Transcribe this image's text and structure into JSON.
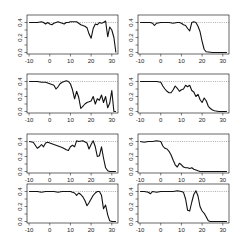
{
  "chart_data": {
    "type": "line",
    "layout": {
      "rows": 4,
      "cols": 2,
      "grid": false,
      "legend": "none"
    },
    "xlim": [
      -11,
      33
    ],
    "ylim": [
      -0.02,
      0.5
    ],
    "x_ticks": [
      -10,
      0,
      10,
      20,
      30
    ],
    "x_tick_labels": [
      "-10",
      "0",
      "10",
      "20",
      "30"
    ],
    "y_ticks": [
      0.0,
      0.2,
      0.4
    ],
    "y_tick_labels": [
      "0.0",
      "0.2",
      "0.4"
    ],
    "reference_line": {
      "y": 0.4,
      "style": "dotted"
    },
    "panels": [
      {
        "id": "r1c1",
        "x": [
          -10,
          -8,
          -6,
          -4,
          -3,
          -2,
          -1,
          0,
          1,
          2,
          3,
          4,
          5,
          6,
          7,
          8,
          9,
          10,
          11,
          12,
          13,
          14,
          15,
          16,
          17,
          18,
          19,
          20,
          21,
          22,
          23,
          24,
          25,
          26,
          27,
          28,
          29,
          30,
          31,
          32
        ],
        "y": [
          0.4,
          0.4,
          0.4,
          0.41,
          0.4,
          0.38,
          0.4,
          0.38,
          0.37,
          0.39,
          0.4,
          0.41,
          0.4,
          0.39,
          0.38,
          0.4,
          0.4,
          0.41,
          0.41,
          0.41,
          0.41,
          0.39,
          0.37,
          0.36,
          0.35,
          0.33,
          0.25,
          0.19,
          0.32,
          0.38,
          0.37,
          0.4,
          0.39,
          0.4,
          0.42,
          0.21,
          0.34,
          0.3,
          0.2,
          0.0
        ]
      },
      {
        "id": "r1c2",
        "x": [
          -10,
          -8,
          -6,
          -5,
          -4,
          -3,
          -2,
          0,
          2,
          4,
          6,
          8,
          9,
          10,
          11,
          12,
          13,
          14,
          15,
          16,
          17,
          18,
          19,
          20,
          21,
          22,
          25,
          28,
          30,
          32
        ],
        "y": [
          0.4,
          0.4,
          0.4,
          0.4,
          0.39,
          0.36,
          0.39,
          0.4,
          0.4,
          0.4,
          0.39,
          0.4,
          0.4,
          0.39,
          0.37,
          0.36,
          0.32,
          0.29,
          0.4,
          0.41,
          0.4,
          0.35,
          0.28,
          0.15,
          0.04,
          0.01,
          0.0,
          0.0,
          0.0,
          0.0
        ]
      },
      {
        "id": "r2c1",
        "x": [
          -10,
          -8,
          -6,
          -4,
          -2,
          0,
          1,
          2,
          3,
          4,
          5,
          6,
          7,
          8,
          9,
          10,
          11,
          12,
          13,
          14,
          15,
          16,
          17,
          18,
          19,
          20,
          21,
          22,
          23,
          24,
          25,
          26,
          27,
          28,
          29,
          30,
          31,
          32
        ],
        "y": [
          0.4,
          0.4,
          0.4,
          0.39,
          0.39,
          0.37,
          0.36,
          0.35,
          0.3,
          0.33,
          0.37,
          0.39,
          0.4,
          0.41,
          0.4,
          0.37,
          0.29,
          0.17,
          0.27,
          0.19,
          0.04,
          0.07,
          0.1,
          0.12,
          0.13,
          0.14,
          0.2,
          0.1,
          0.17,
          0.15,
          0.22,
          0.12,
          0.2,
          0.05,
          0.11,
          0.28,
          0.0,
          0.0
        ]
      },
      {
        "id": "r2c2",
        "x": [
          -10,
          -8,
          -6,
          -4,
          -2,
          0,
          1,
          2,
          3,
          4,
          5,
          6,
          7,
          8,
          9,
          10,
          11,
          12,
          13,
          14,
          15,
          16,
          17,
          18,
          19,
          20,
          21,
          22,
          23,
          24,
          25,
          26,
          28,
          30,
          32
        ],
        "y": [
          0.4,
          0.4,
          0.4,
          0.4,
          0.4,
          0.39,
          0.34,
          0.3,
          0.27,
          0.25,
          0.25,
          0.29,
          0.34,
          0.31,
          0.27,
          0.29,
          0.3,
          0.35,
          0.33,
          0.35,
          0.28,
          0.26,
          0.2,
          0.23,
          0.16,
          0.12,
          0.18,
          0.14,
          0.07,
          0.04,
          0.02,
          0.01,
          0.0,
          0.0,
          0.0
        ]
      },
      {
        "id": "r3c1",
        "x": [
          -10,
          -8,
          -7,
          -6,
          -5,
          -4,
          -3,
          -2,
          -1,
          0,
          2,
          4,
          6,
          8,
          9,
          10,
          11,
          12,
          13,
          14,
          16,
          18,
          19,
          20,
          21,
          22,
          23,
          24,
          25,
          26,
          27,
          28,
          29,
          30,
          32
        ],
        "y": [
          0.4,
          0.39,
          0.35,
          0.31,
          0.33,
          0.36,
          0.33,
          0.38,
          0.39,
          0.38,
          0.36,
          0.34,
          0.32,
          0.29,
          0.28,
          0.33,
          0.35,
          0.33,
          0.41,
          0.4,
          0.41,
          0.38,
          0.3,
          0.36,
          0.41,
          0.33,
          0.2,
          0.21,
          0.33,
          0.18,
          0.05,
          0.01,
          0.0,
          0.0,
          0.0
        ]
      },
      {
        "id": "r3c2",
        "x": [
          -10,
          -8,
          -6,
          -4,
          -2,
          0,
          1,
          2,
          3,
          4,
          5,
          6,
          7,
          8,
          9,
          10,
          11,
          12,
          13,
          14,
          15,
          16,
          17,
          18,
          19,
          20,
          22,
          25,
          28,
          30,
          32
        ],
        "y": [
          0.4,
          0.39,
          0.4,
          0.4,
          0.41,
          0.4,
          0.34,
          0.31,
          0.3,
          0.27,
          0.22,
          0.15,
          0.09,
          0.06,
          0.11,
          0.09,
          0.06,
          0.05,
          0.05,
          0.04,
          0.05,
          0.03,
          0.02,
          0.01,
          0.0,
          0.0,
          0.0,
          0.0,
          0.0,
          0.0,
          0.0
        ]
      },
      {
        "id": "r4c1",
        "x": [
          -10,
          -8,
          -6,
          -4,
          -2,
          0,
          2,
          4,
          6,
          8,
          10,
          12,
          13,
          14,
          15,
          16,
          17,
          18,
          19,
          20,
          21,
          22,
          23,
          24,
          25,
          26,
          27,
          28,
          29,
          30,
          32
        ],
        "y": [
          0.4,
          0.4,
          0.4,
          0.39,
          0.4,
          0.4,
          0.4,
          0.39,
          0.4,
          0.4,
          0.4,
          0.38,
          0.35,
          0.38,
          0.36,
          0.33,
          0.28,
          0.21,
          0.25,
          0.3,
          0.35,
          0.38,
          0.4,
          0.4,
          0.35,
          0.17,
          0.22,
          0.09,
          0.01,
          0.0,
          0.0
        ]
      },
      {
        "id": "r4c2",
        "x": [
          -10,
          -8,
          -6,
          -5,
          -4,
          -2,
          0,
          2,
          4,
          6,
          8,
          10,
          11,
          12,
          13,
          14,
          15,
          16,
          17,
          18,
          19,
          20,
          21,
          22,
          23,
          24,
          26,
          28,
          30,
          32
        ],
        "y": [
          0.4,
          0.4,
          0.39,
          0.37,
          0.4,
          0.39,
          0.4,
          0.4,
          0.4,
          0.4,
          0.41,
          0.4,
          0.39,
          0.3,
          0.15,
          0.14,
          0.26,
          0.36,
          0.41,
          0.34,
          0.2,
          0.14,
          0.11,
          0.06,
          0.01,
          0.0,
          0.0,
          0.0,
          0.0,
          0.0
        ]
      }
    ],
    "title": "",
    "xlabel": "",
    "ylabel": ""
  },
  "geometry": {
    "cols_x": [
      27,
      138
    ],
    "box_width": 91,
    "rows_y": [
      15,
      74,
      134,
      184
    ],
    "box_height": 39
  }
}
